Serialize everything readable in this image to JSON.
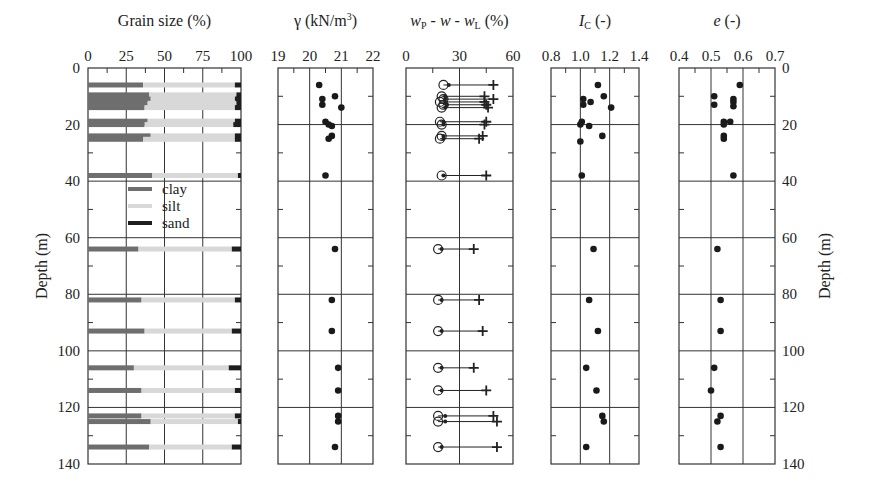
{
  "figure": {
    "depth_label": "Depth (m)",
    "depth_ticks": [
      0,
      20,
      40,
      60,
      80,
      100,
      120,
      140
    ]
  },
  "chart_data": [
    {
      "type": "bar",
      "orientation": "horizontal-stacked",
      "title": "Grain size (%)",
      "xlabel": "Grain size (%)",
      "ylabel": "Depth (m)",
      "xlim": [
        0,
        100
      ],
      "ylim": [
        140,
        0
      ],
      "xticks": [
        0,
        25,
        50,
        75,
        100
      ],
      "legend": [
        {
          "name": "clay",
          "color": "#6e6e6e"
        },
        {
          "name": "silt",
          "color": "#d8d8d8"
        },
        {
          "name": "sand",
          "color": "#1e1e1e"
        }
      ],
      "samples": [
        {
          "depth": 6,
          "thickness": 1.2,
          "clay": 36,
          "silt": 60,
          "sand": 4
        },
        {
          "depth": 9.5,
          "thickness": 1.2,
          "clay": 40,
          "silt": 57,
          "sand": 3
        },
        {
          "depth": 11,
          "thickness": 1.2,
          "clay": 41,
          "silt": 55,
          "sand": 4
        },
        {
          "depth": 12.5,
          "thickness": 1.2,
          "clay": 39,
          "silt": 58,
          "sand": 3
        },
        {
          "depth": 14,
          "thickness": 1.2,
          "clay": 37,
          "silt": 59,
          "sand": 4
        },
        {
          "depth": 18.8,
          "thickness": 1.2,
          "clay": 39,
          "silt": 57,
          "sand": 4
        },
        {
          "depth": 20,
          "thickness": 1.2,
          "clay": 37,
          "silt": 58,
          "sand": 5
        },
        {
          "depth": 24,
          "thickness": 1.2,
          "clay": 41,
          "silt": 55,
          "sand": 4
        },
        {
          "depth": 25.2,
          "thickness": 1.2,
          "clay": 36,
          "silt": 60,
          "sand": 4
        },
        {
          "depth": 38,
          "thickness": 1.2,
          "clay": 42,
          "silt": 56,
          "sand": 2
        },
        {
          "depth": 64,
          "thickness": 1.2,
          "clay": 33,
          "silt": 61,
          "sand": 6
        },
        {
          "depth": 82,
          "thickness": 1.2,
          "clay": 35,
          "silt": 61,
          "sand": 4
        },
        {
          "depth": 93,
          "thickness": 1.2,
          "clay": 37,
          "silt": 57,
          "sand": 6
        },
        {
          "depth": 106,
          "thickness": 1.2,
          "clay": 30,
          "silt": 62,
          "sand": 8
        },
        {
          "depth": 114,
          "thickness": 1.2,
          "clay": 35,
          "silt": 61,
          "sand": 4
        },
        {
          "depth": 123,
          "thickness": 1.2,
          "clay": 35,
          "silt": 61,
          "sand": 4
        },
        {
          "depth": 125,
          "thickness": 1.2,
          "clay": 41,
          "silt": 57,
          "sand": 2
        },
        {
          "depth": 134,
          "thickness": 1.2,
          "clay": 40,
          "silt": 54,
          "sand": 6
        }
      ]
    },
    {
      "type": "scatter",
      "title": "γ (kN/m³)",
      "xlabel": "γ (kN/m³)",
      "xlim": [
        19,
        22
      ],
      "xticks": [
        19,
        20,
        21,
        22
      ],
      "points": [
        {
          "x": 20.3,
          "depth": 6
        },
        {
          "x": 20.8,
          "depth": 10
        },
        {
          "x": 20.4,
          "depth": 11
        },
        {
          "x": 20.4,
          "depth": 13
        },
        {
          "x": 21.0,
          "depth": 14
        },
        {
          "x": 20.5,
          "depth": 19
        },
        {
          "x": 20.6,
          "depth": 20
        },
        {
          "x": 20.7,
          "depth": 20.5
        },
        {
          "x": 20.7,
          "depth": 24
        },
        {
          "x": 20.6,
          "depth": 25
        },
        {
          "x": 20.5,
          "depth": 38
        },
        {
          "x": 20.8,
          "depth": 64
        },
        {
          "x": 20.7,
          "depth": 82
        },
        {
          "x": 20.7,
          "depth": 93
        },
        {
          "x": 20.9,
          "depth": 106
        },
        {
          "x": 20.9,
          "depth": 114
        },
        {
          "x": 20.9,
          "depth": 123
        },
        {
          "x": 20.9,
          "depth": 125
        },
        {
          "x": 20.8,
          "depth": 134
        }
      ]
    },
    {
      "type": "scatter",
      "title": "wP - w - wL (%)",
      "xlabel": "wP - w - wL (%)",
      "xlim": [
        0,
        60
      ],
      "xticks": [
        0,
        30,
        60
      ],
      "markers": {
        "wP": "open circle",
        "w": "open circle",
        "wL": "plus"
      },
      "points": [
        {
          "depth": 6,
          "wP": 21,
          "w": 24,
          "wL": 49
        },
        {
          "depth": 10,
          "wP": 20,
          "w": 22,
          "wL": 44
        },
        {
          "depth": 11,
          "wP": 21,
          "w": 22,
          "wL": 49
        },
        {
          "depth": 12,
          "wP": 19,
          "w": 22,
          "wL": 44
        },
        {
          "depth": 13,
          "wP": 21,
          "w": 23,
          "wL": 45
        },
        {
          "depth": 14,
          "wP": 20,
          "w": 22,
          "wL": 46
        },
        {
          "depth": 19,
          "wP": 19,
          "w": 21,
          "wL": 45
        },
        {
          "depth": 20,
          "wP": 20,
          "w": 21,
          "wL": 44
        },
        {
          "depth": 24,
          "wP": 20,
          "w": 21,
          "wL": 43
        },
        {
          "depth": 25,
          "wP": 19,
          "w": 21,
          "wL": 41
        },
        {
          "depth": 38,
          "wP": 20,
          "w": 21,
          "wL": 45
        },
        {
          "depth": 64,
          "wP": 18,
          "w": 20,
          "wL": 38
        },
        {
          "depth": 82,
          "wP": 18,
          "w": 20,
          "wL": 41
        },
        {
          "depth": 93,
          "wP": 18,
          "w": 20,
          "wL": 43
        },
        {
          "depth": 106,
          "wP": 18,
          "w": 20,
          "wL": 38
        },
        {
          "depth": 114,
          "wP": 18,
          "w": 20,
          "wL": 45
        },
        {
          "depth": 123,
          "wP": 18,
          "w": 22,
          "wL": 49
        },
        {
          "depth": 125,
          "wP": 18,
          "w": 22,
          "wL": 51
        },
        {
          "depth": 134,
          "wP": 18,
          "w": 20,
          "wL": 51
        }
      ]
    },
    {
      "type": "scatter",
      "title": "IC (-)",
      "xlabel": "IC (-)",
      "xlim": [
        0.8,
        1.4
      ],
      "xticks": [
        0.8,
        1.0,
        1.2,
        1.4
      ],
      "points": [
        {
          "x": 1.12,
          "depth": 6
        },
        {
          "x": 1.16,
          "depth": 10
        },
        {
          "x": 1.02,
          "depth": 11
        },
        {
          "x": 1.07,
          "depth": 12
        },
        {
          "x": 1.02,
          "depth": 13
        },
        {
          "x": 1.21,
          "depth": 14
        },
        {
          "x": 1.01,
          "depth": 19
        },
        {
          "x": 1.0,
          "depth": 20
        },
        {
          "x": 1.06,
          "depth": 20.5
        },
        {
          "x": 1.15,
          "depth": 24
        },
        {
          "x": 1.0,
          "depth": 26
        },
        {
          "x": 1.01,
          "depth": 38
        },
        {
          "x": 1.09,
          "depth": 64
        },
        {
          "x": 1.06,
          "depth": 82
        },
        {
          "x": 1.12,
          "depth": 93
        },
        {
          "x": 1.04,
          "depth": 106
        },
        {
          "x": 1.11,
          "depth": 114
        },
        {
          "x": 1.15,
          "depth": 123
        },
        {
          "x": 1.16,
          "depth": 125
        },
        {
          "x": 1.04,
          "depth": 134
        }
      ]
    },
    {
      "type": "scatter",
      "title": "e (-)",
      "xlabel": "e (-)",
      "xlim": [
        0.4,
        0.7
      ],
      "xticks": [
        0.4,
        0.5,
        0.6,
        0.7
      ],
      "points": [
        {
          "x": 0.59,
          "depth": 6
        },
        {
          "x": 0.51,
          "depth": 10
        },
        {
          "x": 0.57,
          "depth": 11
        },
        {
          "x": 0.57,
          "depth": 12
        },
        {
          "x": 0.51,
          "depth": 13
        },
        {
          "x": 0.57,
          "depth": 13.5
        },
        {
          "x": 0.54,
          "depth": 19
        },
        {
          "x": 0.56,
          "depth": 19
        },
        {
          "x": 0.54,
          "depth": 20
        },
        {
          "x": 0.54,
          "depth": 24
        },
        {
          "x": 0.54,
          "depth": 25
        },
        {
          "x": 0.57,
          "depth": 38
        },
        {
          "x": 0.52,
          "depth": 64
        },
        {
          "x": 0.53,
          "depth": 82
        },
        {
          "x": 0.53,
          "depth": 93
        },
        {
          "x": 0.51,
          "depth": 106
        },
        {
          "x": 0.5,
          "depth": 114
        },
        {
          "x": 0.53,
          "depth": 123
        },
        {
          "x": 0.52,
          "depth": 125
        },
        {
          "x": 0.53,
          "depth": 134
        }
      ]
    }
  ]
}
